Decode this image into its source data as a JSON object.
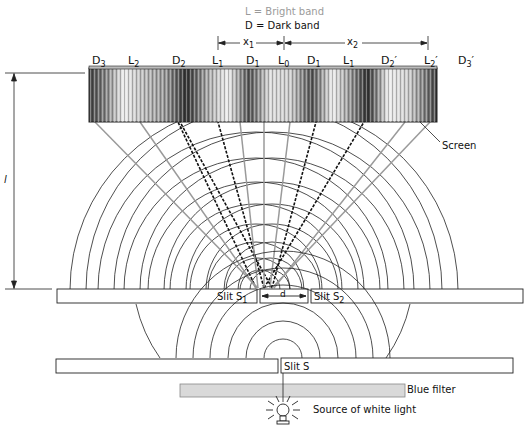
{
  "legend": {
    "bright": "L = Bright band",
    "dark": "D = Dark band"
  },
  "dimensions": {
    "x1": "x",
    "x1_sub": "1",
    "x2": "x",
    "x2_sub": "2",
    "l": "l",
    "d": "d"
  },
  "bands": [
    {
      "base": "D",
      "sub": "3",
      "prime": ""
    },
    {
      "base": "L",
      "sub": "2",
      "prime": ""
    },
    {
      "base": "D",
      "sub": "2",
      "prime": ""
    },
    {
      "base": "L",
      "sub": "1",
      "prime": ""
    },
    {
      "base": "D",
      "sub": "1",
      "prime": ""
    },
    {
      "base": "L",
      "sub": "0",
      "prime": ""
    },
    {
      "base": "D",
      "sub": "1",
      "prime": ""
    },
    {
      "base": "L",
      "sub": "1",
      "prime": ""
    },
    {
      "base": "D",
      "sub": "2",
      "prime": "′"
    },
    {
      "base": "L",
      "sub": "2",
      "prime": "′"
    },
    {
      "base": "D",
      "sub": "3",
      "prime": "′"
    }
  ],
  "labels": {
    "screen": "Screen",
    "slit_s1": "Slit S",
    "slit_s1_sub": "1",
    "slit_s2": "Slit S",
    "slit_s2_sub": "2",
    "slit_s": "Slit S",
    "blue_filter": "Blue filter",
    "source": "Source of white light"
  },
  "colors": {
    "line": "#222222",
    "bright_ray": "#9a9a9a",
    "filter": "#d9d9d9"
  }
}
